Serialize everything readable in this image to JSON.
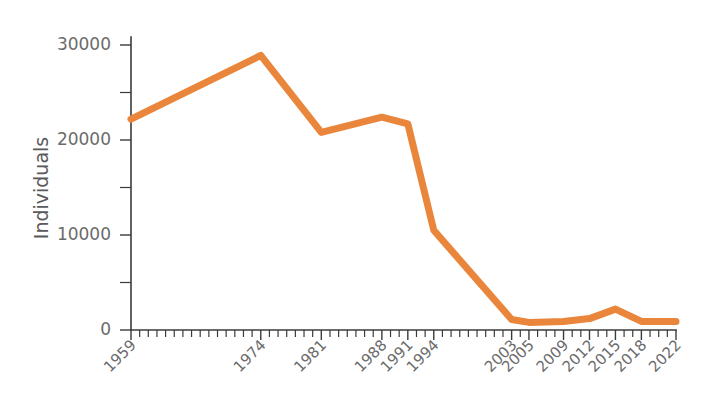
{
  "chart_data": {
    "type": "line",
    "title": "",
    "subtitle": "",
    "xlabel": "",
    "ylabel": "Individuals",
    "xlim": [
      1959,
      2022
    ],
    "ylim": [
      0,
      30000
    ],
    "grid": false,
    "legend": null,
    "legend_position": "none",
    "series_color": "#E9863C",
    "axis_color": "#3b3b3b",
    "tick_label_color": "#6b6b6b",
    "x_tick_labels": [
      "1959",
      "1974",
      "1981",
      "1988",
      "1991",
      "1994",
      "2003",
      "2005",
      "2009",
      "2012",
      "2015",
      "2018",
      "2022"
    ],
    "y_tick_labels": [
      "0",
      "10000",
      "20000",
      "30000"
    ],
    "y_ticks_major": [
      0,
      10000,
      20000,
      30000
    ],
    "y_ticks_minor": [
      5000,
      15000,
      25000
    ],
    "series": [
      {
        "name": "Individuals",
        "x": [
          1959,
          1974,
          1981,
          1988,
          1991,
          1994,
          2003,
          2005,
          2009,
          2012,
          2015,
          2018,
          2022
        ],
        "values": [
          22200,
          28900,
          20800,
          22400,
          21700,
          10500,
          1100,
          800,
          900,
          1200,
          2200,
          900,
          900
        ]
      }
    ]
  }
}
